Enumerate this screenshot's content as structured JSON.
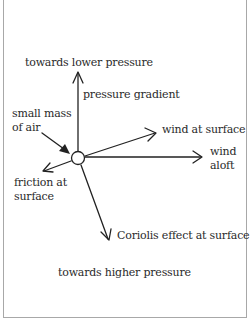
{
  "diagram": {
    "labels": {
      "top": "towards lower pressure",
      "bottom": "towards higher pressure",
      "pressure_gradient": "pressure gradient",
      "wind_surface": "wind at surface",
      "wind_aloft_1": "wind",
      "wind_aloft_2": "aloft",
      "mass_1": "small mass",
      "mass_2": "of air",
      "friction_1": "friction at",
      "friction_2": "surface",
      "coriolis": "Coriolis effect at surface"
    },
    "center": {
      "x": 78,
      "y": 158,
      "r": 7
    },
    "arrows": [
      {
        "name": "pressure-gradient",
        "to": [
          78,
          72
        ]
      },
      {
        "name": "wind-at-surface",
        "to": [
          156,
          133
        ]
      },
      {
        "name": "wind-aloft",
        "to": [
          202,
          157
        ]
      },
      {
        "name": "friction-at-surface",
        "to": [
          43,
          171
        ]
      },
      {
        "name": "coriolis-effect-at-surface",
        "to": [
          109,
          240
        ]
      }
    ],
    "colors": {
      "line": "#222222",
      "text": "#2a2a2a",
      "border": "#a8a8a8"
    }
  }
}
